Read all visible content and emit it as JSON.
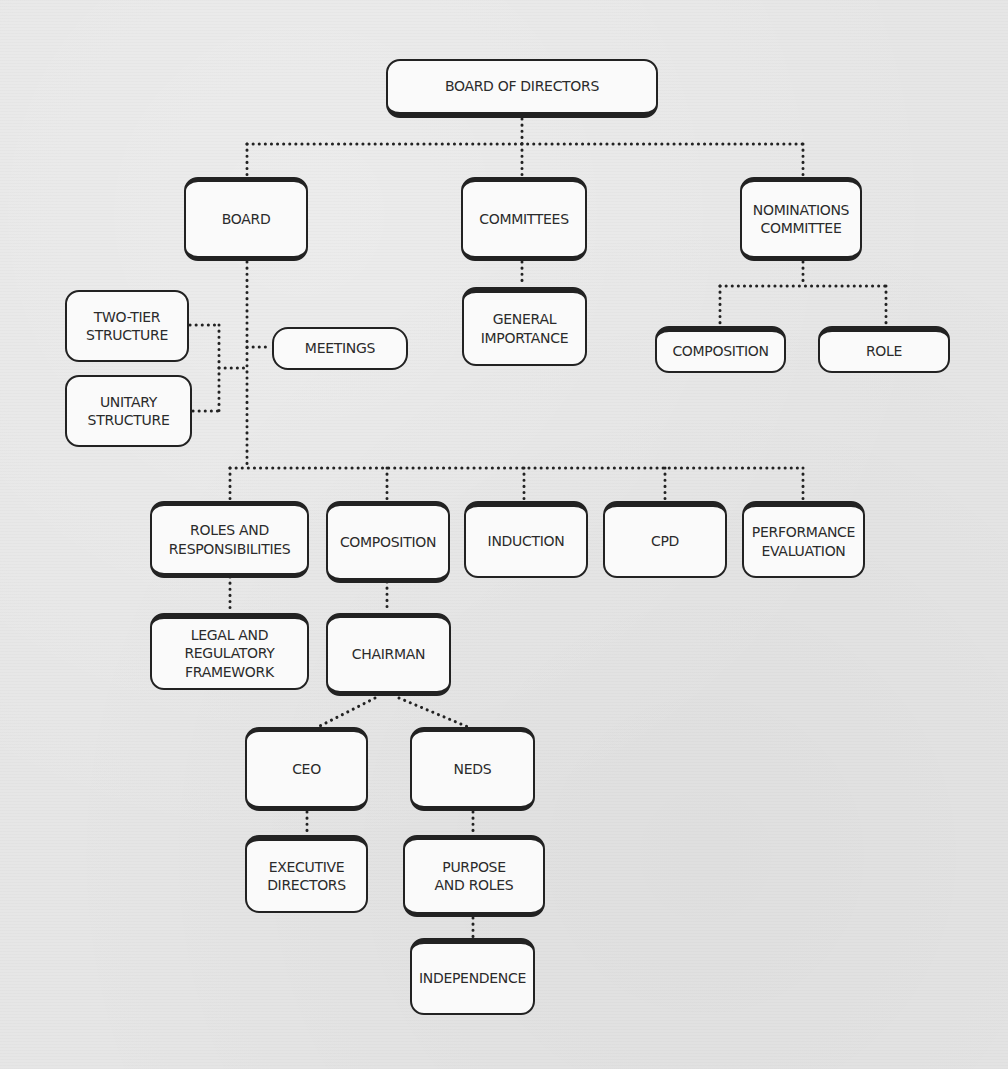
{
  "diagram": {
    "title": "Board of Directors",
    "background_color": "#e6e6e6",
    "node_fill": "#fafafa",
    "line_color": "#222222",
    "nodes": {
      "board_of_directors": "BOARD OF DIRECTORS",
      "board": "BOARD",
      "committees": "COMMITTEES",
      "nominations_committee": "NOMINATIONS\nCOMMITTEE",
      "two_tier_structure": "TWO-TIER\nSTRUCTURE",
      "unitary_structure": "UNITARY\nSTRUCTURE",
      "meetings": "MEETINGS",
      "general_importance": "GENERAL\nIMPORTANCE",
      "nom_composition": "COMPOSITION",
      "nom_role": "ROLE",
      "roles_and_responsibilities": "ROLES AND\nRESPONSIBILITIES",
      "composition": "COMPOSITION",
      "induction": "INDUCTION",
      "cpd": "CPD",
      "performance_evaluation": "PERFORMANCE\nEVALUATION",
      "legal_regulatory_framework": "LEGAL AND\nREGULATORY\nFRAMEWORK",
      "chairman": "CHAIRMAN",
      "ceo": "CEO",
      "neds": "NEDS",
      "executive_directors": "EXECUTIVE\nDIRECTORS",
      "purpose_and_roles": "PURPOSE\nAND ROLES",
      "independence": "INDEPENDENCE"
    },
    "edges": [
      [
        "BOARD OF DIRECTORS",
        "BOARD"
      ],
      [
        "BOARD OF DIRECTORS",
        "COMMITTEES"
      ],
      [
        "BOARD OF DIRECTORS",
        "NOMINATIONS COMMITTEE"
      ],
      [
        "BOARD",
        "MEETINGS"
      ],
      [
        "BOARD",
        "TWO-TIER STRUCTURE"
      ],
      [
        "BOARD",
        "UNITARY STRUCTURE"
      ],
      [
        "BOARD",
        "ROLES AND RESPONSIBILITIES"
      ],
      [
        "BOARD",
        "COMPOSITION"
      ],
      [
        "BOARD",
        "INDUCTION"
      ],
      [
        "BOARD",
        "CPD"
      ],
      [
        "BOARD",
        "PERFORMANCE EVALUATION"
      ],
      [
        "COMMITTEES",
        "GENERAL IMPORTANCE"
      ],
      [
        "NOMINATIONS COMMITTEE",
        "COMPOSITION"
      ],
      [
        "NOMINATIONS COMMITTEE",
        "ROLE"
      ],
      [
        "ROLES AND RESPONSIBILITIES",
        "LEGAL AND REGULATORY FRAMEWORK"
      ],
      [
        "COMPOSITION",
        "CHAIRMAN"
      ],
      [
        "CHAIRMAN",
        "CEO"
      ],
      [
        "CHAIRMAN",
        "NEDS"
      ],
      [
        "CEO",
        "EXECUTIVE DIRECTORS"
      ],
      [
        "NEDS",
        "PURPOSE AND ROLES"
      ],
      [
        "PURPOSE AND ROLES",
        "INDEPENDENCE"
      ]
    ]
  }
}
